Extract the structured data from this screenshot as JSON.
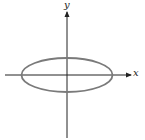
{
  "diagram": {
    "type": "ellipse-on-axes",
    "axes": {
      "x_label": "x",
      "y_label": "y",
      "color": "#222222"
    },
    "ellipse": {
      "cx": 67,
      "cy": 75,
      "rx": 45.5,
      "ry": 17,
      "stroke": "#7a7a7a",
      "stroke_width": 1.8
    }
  }
}
